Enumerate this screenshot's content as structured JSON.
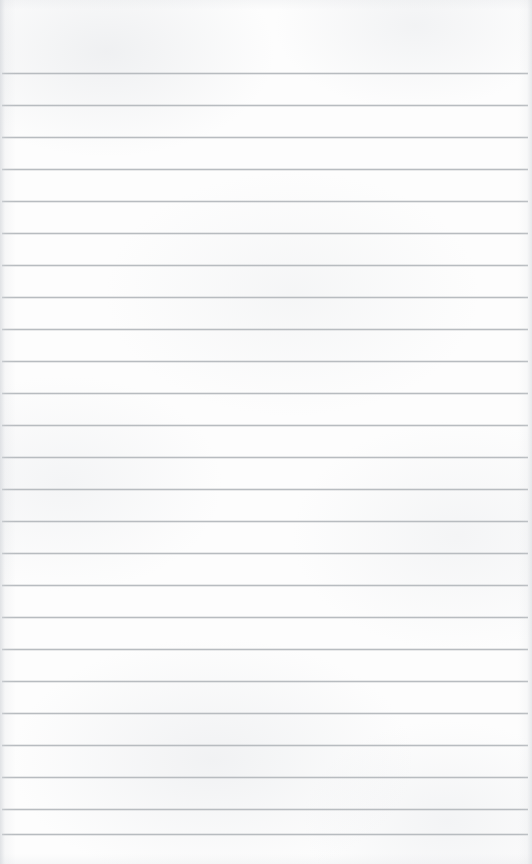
{
  "document": {
    "kind": "ruled-notebook-paper-scan",
    "has_text_content": false,
    "page_width": 532,
    "page_height": 864,
    "background_color": "#fdfdfd",
    "edge_shadow_color": "#d6d9dd"
  },
  "ruling": {
    "line_color": "#b8bcc0",
    "line_thickness": 1,
    "line_spacing": 32,
    "first_line_y": 73,
    "last_line_y": 834,
    "line_start_x": 2,
    "line_end_x": 528,
    "line_count": 25,
    "top_margin": 73,
    "bottom_margin": 30,
    "line_y_positions": [
      73,
      105,
      137,
      169,
      201,
      233,
      265,
      297,
      329,
      361,
      393,
      425,
      457,
      489,
      521,
      553,
      585,
      617,
      649,
      681,
      713,
      745,
      777,
      809,
      834
    ]
  }
}
